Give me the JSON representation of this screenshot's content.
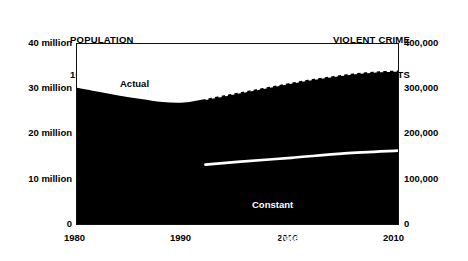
{
  "header": {
    "left_title_line1": "POPULATION",
    "left_title_line2": "10–17 IN 1,000s",
    "right_title_line1": "VIOLENT CRIME",
    "right_title_line2": "INDEX ARRESTS"
  },
  "labels": {
    "actual": "Actual",
    "constant_line1": "Constant",
    "constant_line2": "arrest rates"
  },
  "axes": {
    "left_ticks": [
      "40 million",
      "30 million",
      "20 million",
      "10 million",
      "0"
    ],
    "right_ticks": [
      "400,000",
      "300,000",
      "200,000",
      "100,000",
      "0"
    ],
    "x_ticks": [
      "1980",
      "1990",
      "2000",
      "2010"
    ]
  },
  "colors": {
    "area_fill": "#000000",
    "frame": "#111111",
    "background": "#ffffff",
    "constant_line": "#ffffff",
    "projection_dash": "#ffffff"
  },
  "chart_data": {
    "type": "area",
    "title": "",
    "subtitle": "",
    "xlabel": "",
    "ylabel": "POPULATION 10-17 IN 1,000s",
    "y2label": "VIOLENT CRIME INDEX ARRESTS",
    "xlim": [
      1980,
      2010
    ],
    "ylim": [
      0,
      40
    ],
    "y2lim": [
      0,
      400000
    ],
    "y_ticks": [
      0,
      10,
      20,
      30,
      40
    ],
    "y_tick_labels": [
      "0",
      "10 million",
      "20 million",
      "30 million",
      "40 million"
    ],
    "y2_ticks": [
      0,
      100000,
      200000,
      300000,
      400000
    ],
    "y2_tick_labels": [
      "0",
      "100,000",
      "200,000",
      "300,000",
      "400,000"
    ],
    "x_ticks": [
      1980,
      1990,
      2000,
      2010
    ],
    "grid": false,
    "legend": "in-plot annotations",
    "series": [
      {
        "name": "Actual",
        "style": "filled-area-solid-edge",
        "units": "millions of youth ages 10-17",
        "x": [
          1980,
          1982,
          1984,
          1986,
          1988,
          1990,
          1992
        ],
        "values": [
          30.3,
          29.4,
          28.5,
          27.8,
          27.1,
          27.0,
          27.8
        ]
      },
      {
        "name": "Projected",
        "style": "filled-area-dashed-edge",
        "units": "millions of youth ages 10-17",
        "x": [
          1992,
          1994,
          1996,
          1998,
          2000,
          2002,
          2004,
          2006,
          2008,
          2010
        ],
        "values": [
          27.8,
          28.7,
          29.6,
          30.5,
          31.4,
          32.2,
          32.9,
          33.5,
          33.9,
          34.1
        ]
      },
      {
        "name": "Constant arrest rates",
        "style": "white-line",
        "units": "violent crime index arrests",
        "x": [
          1992,
          1995,
          2000,
          2005,
          2010
        ],
        "values": [
          132000,
          138000,
          147000,
          157000,
          163000
        ]
      }
    ],
    "annotations": [
      {
        "text": "Actual",
        "x": 1984,
        "y": 31.5
      },
      {
        "text": "Constant arrest rates",
        "x": 2000,
        "y": 11.5
      }
    ]
  }
}
